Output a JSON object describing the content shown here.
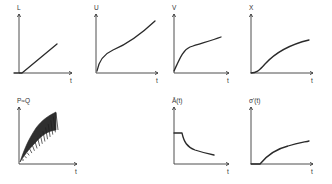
{
  "figure": {
    "panels": [
      {
        "id": "L",
        "ylabel": "L",
        "xlabel": "t",
        "ox": 19,
        "oy": 73,
        "w": 53,
        "h": 59,
        "path": "M14,73 L22,73 L57,44"
      },
      {
        "id": "U",
        "ylabel": "U",
        "xlabel": "t",
        "ox": 96,
        "oy": 73,
        "w": 62,
        "h": 59,
        "path": "M97,71 C99,60 104,54 113,50 C125,45 138,37 155,21"
      },
      {
        "id": "V",
        "ylabel": "V",
        "xlabel": "t",
        "ox": 174,
        "oy": 73,
        "w": 55,
        "h": 59,
        "path": "M174,71 C180,58 183,50 190,47 C198,44 210,41 221,37"
      },
      {
        "id": "X",
        "ylabel": "X",
        "xlabel": "t",
        "ox": 251,
        "oy": 73,
        "w": 62,
        "h": 59,
        "path": "M251,73 C256,73 259,71 265,64 C275,53 288,45 309,40"
      },
      {
        "id": "PQ",
        "ylabel": "P≈Q",
        "xlabel": "t",
        "ox": 19,
        "oy": 164,
        "w": 58,
        "h": 57,
        "band_upper": "M20,162 C24,150 28,140 36,128 C42,120 48,116 56,112",
        "band_lower": "M56,130 C48,131 42,135 36,142 C28,150 24,156 20,162"
      },
      {
        "id": "A",
        "ylabel": "Ā(t)",
        "xlabel": "t",
        "ox": 174,
        "oy": 164,
        "w": 55,
        "h": 57,
        "path": "M174,133 L182,133 C184,142 187,147 195,150 C204,153 214,155 214,155"
      },
      {
        "id": "S",
        "ylabel": "σ'(t)",
        "xlabel": "t",
        "ox": 251,
        "oy": 164,
        "w": 62,
        "h": 57,
        "path": "M251,164 L260,164 C268,154 276,149 288,146 C298,143 305,142 309,141"
      }
    ]
  }
}
